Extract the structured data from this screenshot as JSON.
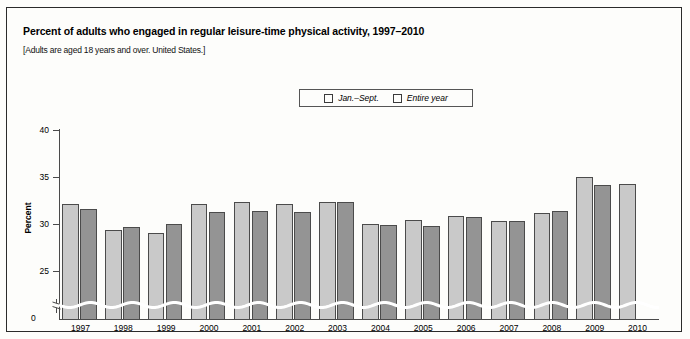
{
  "header": {
    "title": "Percent of adults who engaged in regular leisure-time physical activity, 1997–2010",
    "subtitle": "[Adults are aged 18 years and over. United States.]"
  },
  "legend": {
    "items": [
      {
        "label": "Jan.–Sept.",
        "color": "#c9c9c9"
      },
      {
        "label": "Entire year",
        "color": "#949494"
      }
    ]
  },
  "axes": {
    "y_title": "Percent",
    "y_ticks": [
      "40",
      "35",
      "30",
      "25"
    ],
    "zero_label": "0"
  },
  "chart_data": {
    "type": "bar",
    "title": "Percent of adults who engaged in regular leisure-time physical activity, 1997–2010",
    "subtitle": "[Adults are aged 18 years and over. United States.]",
    "xlabel": "",
    "ylabel": "Percent",
    "ylim": [
      24,
      40
    ],
    "y_ticks": [
      25,
      30,
      35,
      40
    ],
    "axis_break": true,
    "grid": false,
    "legend_position": "top-center",
    "categories": [
      "1997",
      "1998",
      "1999",
      "2000",
      "2001",
      "2002",
      "2003",
      "2004",
      "2005",
      "2006",
      "2007",
      "2008",
      "2009",
      "2010"
    ],
    "series": [
      {
        "name": "Jan.–Sept.",
        "color": "#c9c9c9",
        "values": [
          32.2,
          29.5,
          29.2,
          32.2,
          32.4,
          32.2,
          32.4,
          30.1,
          30.5,
          31.0,
          30.4,
          31.3,
          35.1,
          34.4
        ]
      },
      {
        "name": "Entire year",
        "color": "#949494",
        "values": [
          31.7,
          29.8,
          30.1,
          31.4,
          31.5,
          31.4,
          32.4,
          30.0,
          29.9,
          30.9,
          30.4,
          31.5,
          34.3,
          null
        ]
      }
    ]
  }
}
